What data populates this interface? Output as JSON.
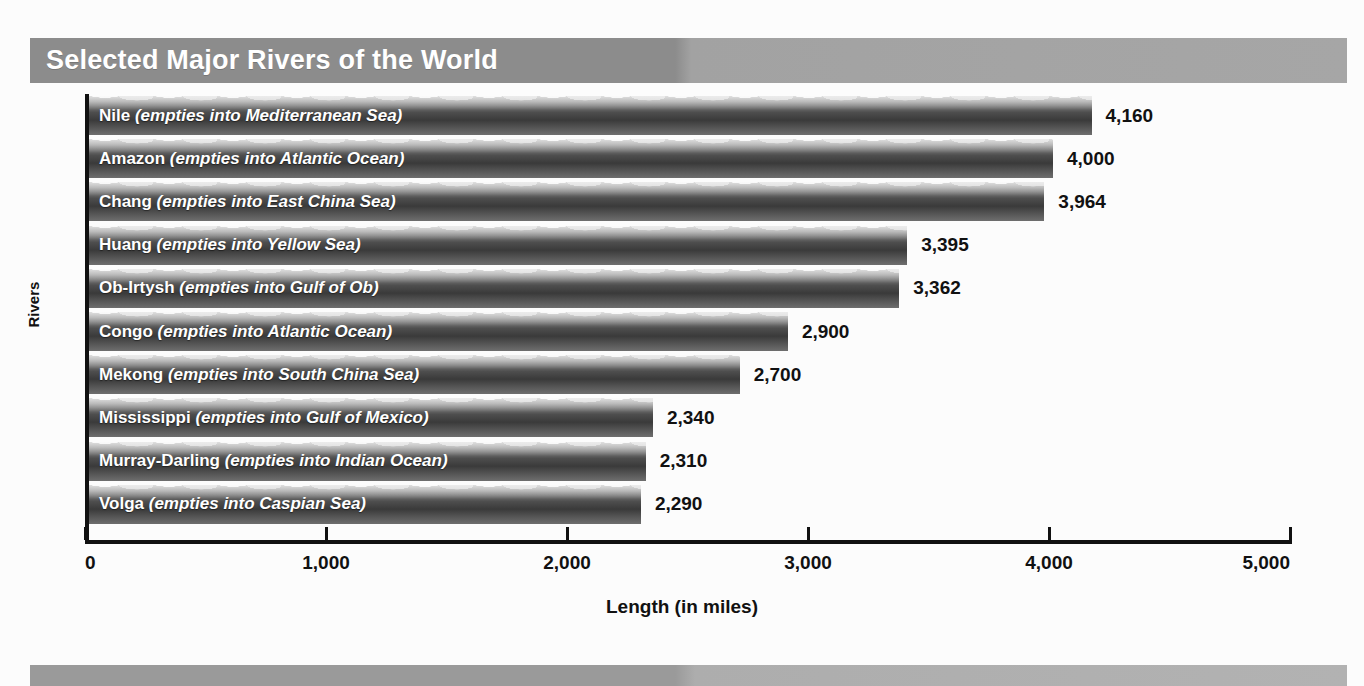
{
  "banner": {
    "title": "Selected Major Rivers of the World"
  },
  "chart_data": {
    "type": "bar",
    "orientation": "horizontal",
    "title": "Selected Major Rivers of the World",
    "xlabel": "Length (in miles)",
    "ylabel": "Rivers",
    "xlim": [
      0,
      5000
    ],
    "xticks": [
      0,
      1000,
      2000,
      3000,
      4000,
      5000
    ],
    "xtick_labels": [
      "0",
      "1,000",
      "2,000",
      "3,000",
      "4,000",
      "5,000"
    ],
    "grid": false,
    "legend": false,
    "categories": [
      "Nile",
      "Amazon",
      "Chang",
      "Huang",
      "Ob-Irtysh",
      "Congo",
      "Mekong",
      "Mississippi",
      "Murray-Darling",
      "Volga"
    ],
    "values": [
      4160,
      4000,
      3964,
      3395,
      3362,
      2900,
      2700,
      2340,
      2310,
      2290
    ],
    "value_labels": [
      "4,160",
      "4,000",
      "3,964",
      "3,395",
      "3,362",
      "2,900",
      "2,700",
      "2,340",
      "2,310",
      "2,290"
    ],
    "bars": [
      {
        "name": "Nile",
        "destination": "(empties into Mediterranean Sea)",
        "value": 4160,
        "value_label": "4,160"
      },
      {
        "name": "Amazon",
        "destination": "(empties into Atlantic Ocean)",
        "value": 4000,
        "value_label": "4,000"
      },
      {
        "name": "Chang",
        "destination": "(empties into East China Sea)",
        "value": 3964,
        "value_label": "3,964"
      },
      {
        "name": "Huang",
        "destination": "(empties into Yellow Sea)",
        "value": 3395,
        "value_label": "3,395"
      },
      {
        "name": "Ob-Irtysh",
        "destination": "(empties into Gulf of Ob)",
        "value": 3362,
        "value_label": "3,362"
      },
      {
        "name": "Congo",
        "destination": "(empties into Atlantic Ocean)",
        "value": 2900,
        "value_label": "2,900"
      },
      {
        "name": "Mekong",
        "destination": "(empties into South China Sea)",
        "value": 2700,
        "value_label": "2,700"
      },
      {
        "name": "Mississippi",
        "destination": "(empties into Gulf of Mexico)",
        "value": 2340,
        "value_label": "2,340"
      },
      {
        "name": "Murray-Darling",
        "destination": "(empties into Indian Ocean)",
        "value": 2310,
        "value_label": "2,310"
      },
      {
        "name": "Volga",
        "destination": "(empties into Caspian Sea)",
        "value": 2290,
        "value_label": "2,290"
      }
    ]
  },
  "colors": {
    "banner_dark": "#8c8c8c",
    "banner_light": "#a6a6a6",
    "bar_dark": "#3a3a3a",
    "bar_light": "#b8b8b8",
    "axis": "#111111",
    "page_background": "#fcfcfc",
    "label_text": "#ffffff"
  }
}
